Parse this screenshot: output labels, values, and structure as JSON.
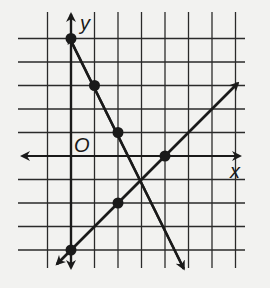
{
  "chart_data": {
    "type": "line",
    "title": "",
    "xlabel": "x",
    "ylabel": "y",
    "origin_label": "O",
    "grid": true,
    "xlim": [
      -1,
      7
    ],
    "ylim": [
      -4,
      5
    ],
    "series": [
      {
        "name": "line-1",
        "equation": "y = -2x + 5",
        "points": [
          [
            0,
            5
          ],
          [
            1,
            3
          ],
          [
            2,
            1
          ]
        ]
      },
      {
        "name": "line-2",
        "equation": "y = x - 4",
        "points": [
          [
            0,
            -4
          ],
          [
            2,
            -2
          ],
          [
            4,
            0
          ]
        ]
      }
    ],
    "intersection": [
      3,
      -1
    ]
  },
  "labels": {
    "x": "x",
    "y": "y",
    "origin": "O"
  },
  "colors": {
    "ink": "#1a1a1a",
    "paper": "#f2f2f0"
  }
}
